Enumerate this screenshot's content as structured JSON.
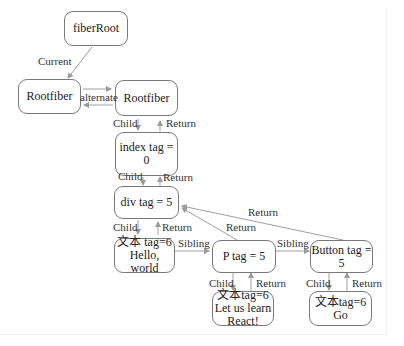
{
  "diagram": {
    "nodes": {
      "fiber_root": "fiberRoot",
      "rootfiber_current": "Rootfiber",
      "rootfiber_alternate": "Rootfiber",
      "index": "index tag = 0",
      "div": "div tag = 5",
      "text1_line1": "文本 tag=6",
      "text1_line2": "Hello, world",
      "p": "P tag = 5",
      "button": "Button tag = 5",
      "text2_line1": "文本tag=6",
      "text2_line2": "Let us learn",
      "text2_line3": "React!",
      "text3_line1": "文本tag=6",
      "text3_line2": "Go"
    },
    "edges": {
      "current": "Current",
      "alternate": "alternate",
      "child": "Child",
      "return": "Return",
      "sibling": "Sibling"
    },
    "colors": {
      "border": "#7a7a7a",
      "edge": "#9a9a9a",
      "text": "#222222"
    }
  }
}
